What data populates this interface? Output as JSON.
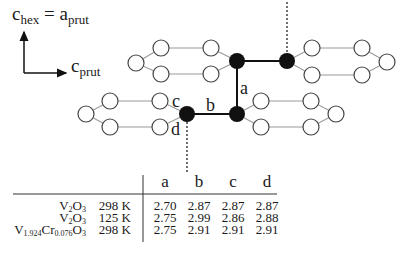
{
  "axes": {
    "vertical_label": {
      "main": "c",
      "sub": "hex",
      "eq": " = ",
      "main2": "a",
      "sub2": "prut"
    },
    "horizontal_label": {
      "main": "c",
      "sub": "prut"
    }
  },
  "diagram": {
    "bond_labels": {
      "a": "a",
      "b": "b",
      "c": "c",
      "d": "d"
    },
    "colors": {
      "filled_atom": "#111111",
      "open_atom_stroke": "#444444",
      "bond": "#111111",
      "ring_line": "#999999"
    }
  },
  "table": {
    "headers": [
      "a",
      "b",
      "c",
      "d"
    ],
    "rows": [
      {
        "compound": {
          "parts": [
            [
              "V",
              "2"
            ],
            [
              "O",
              "3"
            ]
          ]
        },
        "temperature": "298 K",
        "values": [
          "2.70",
          "2.87",
          "2.87",
          "2.87"
        ]
      },
      {
        "compound": {
          "parts": [
            [
              "V",
              "2"
            ],
            [
              "O",
              "3"
            ]
          ]
        },
        "temperature": "125 K",
        "values": [
          "2.75",
          "2.99",
          "2.86",
          "2.88"
        ]
      },
      {
        "compound": {
          "parts": [
            [
              "V",
              "1.924"
            ],
            [
              "Cr",
              "0.076"
            ],
            [
              "O",
              "3"
            ]
          ]
        },
        "temperature": "298 K",
        "values": [
          "2.75",
          "2.91",
          "2.91",
          "2.91"
        ]
      }
    ]
  }
}
